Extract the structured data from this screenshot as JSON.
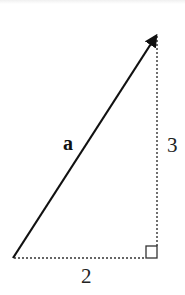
{
  "diagram": {
    "type": "vector-components",
    "vector": {
      "label": "a",
      "from": [
        0,
        0
      ],
      "to": [
        2,
        3
      ]
    },
    "components": {
      "horizontal": {
        "label": "2",
        "value": 2
      },
      "vertical": {
        "label": "3",
        "value": 3
      }
    },
    "right_angle_marker": true,
    "colors": {
      "vector": "#111111",
      "dotted_lines": "#333333",
      "marker": "#333333",
      "text": "#222222"
    }
  }
}
